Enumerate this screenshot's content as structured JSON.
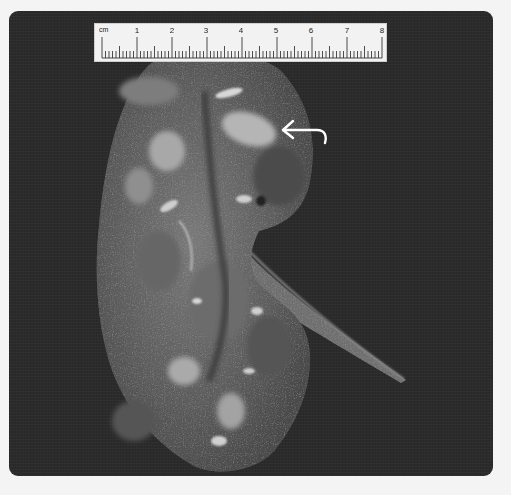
{
  "image": {
    "subject": "bisected kidney gross specimen",
    "background_color": "#2b2b2b",
    "frame_color": "#f4f4f4"
  },
  "ruler": {
    "unit_label": "cm",
    "labels": [
      "1",
      "2",
      "3",
      "4",
      "5",
      "6",
      "7",
      "8"
    ],
    "minor_divisions_per_cm": 10
  },
  "annotation": {
    "arrow": "curved-arrow-icon",
    "arrow_color": "#ffffff"
  }
}
